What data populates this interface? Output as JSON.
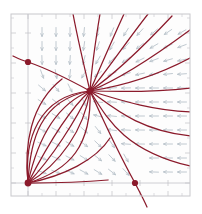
{
  "figure": {
    "kind": "phase-portrait",
    "width": 202,
    "height": 214,
    "background_color": "#ffffff",
    "plot_background_color": "#fdfdfd",
    "frame_color": "#c8c8cc",
    "axis_color": "#c2c2c8",
    "tick_color": "#c8c8cc",
    "trajectory_color": "#8b1a2b",
    "arrow_color": "#b9c3cb",
    "fixed_point_color": "#8b1a2b"
  },
  "chart_data": {
    "type": "scatter",
    "title": "",
    "subtitle": "",
    "xlabel": "",
    "ylabel": "",
    "grid": false,
    "legend_position": "none",
    "axis_ranges": {
      "xlim": [
        -0.5,
        4.5
      ],
      "ylim": [
        -0.5,
        4.5
      ]
    },
    "frame_px": {
      "left": 11,
      "top": 14,
      "right": 190,
      "bottom": 196
    },
    "axes_px": {
      "vertical_x": 28,
      "horizontal_y": 183
    },
    "tick_labels": {
      "x": [],
      "y": []
    },
    "tick_positions_px": {
      "x": [
        28,
        56,
        84,
        112,
        140,
        168
      ],
      "y": [
        183,
        153,
        123,
        93,
        63,
        33
      ],
      "minor_x": [
        42,
        70,
        98,
        126,
        154,
        182
      ],
      "minor_y": [
        168,
        138,
        108,
        78,
        48,
        18
      ]
    },
    "fixed_points": [
      {
        "name": "left-equilibrium",
        "x_px": 28,
        "y_px": 62,
        "type": "saddle",
        "radius_px": 3.1
      },
      {
        "name": "origin-node",
        "x_px": 28,
        "y_px": 183,
        "type": "unstable-node",
        "radius_px": 3.4
      },
      {
        "name": "right-equilibrium",
        "x_px": 135,
        "y_px": 183,
        "type": "saddle",
        "radius_px": 3.1
      },
      {
        "name": "interior-node",
        "x_px": 90,
        "y_px": 91,
        "type": "stable-node",
        "radius_px": 3.4
      }
    ],
    "vector_field": {
      "description": "arrow glyphs on a regular lattice; arrows point down in upper-left region, down-left in upper-right, left along the right band, and up-right in the lower-middle region",
      "glyph_length_px": 9,
      "lattice_spacing_px": 14,
      "arrows": [
        {
          "x": 42,
          "y": 32,
          "angle": 90
        },
        {
          "x": 56,
          "y": 32,
          "angle": 90
        },
        {
          "x": 70,
          "y": 32,
          "angle": 90
        },
        {
          "x": 84,
          "y": 32,
          "angle": 96
        },
        {
          "x": 98,
          "y": 32,
          "angle": 104
        },
        {
          "x": 112,
          "y": 32,
          "angle": 112
        },
        {
          "x": 126,
          "y": 32,
          "angle": 122
        },
        {
          "x": 140,
          "y": 32,
          "angle": 132
        },
        {
          "x": 154,
          "y": 32,
          "angle": 140
        },
        {
          "x": 168,
          "y": 32,
          "angle": 146
        },
        {
          "x": 182,
          "y": 32,
          "angle": 150
        },
        {
          "x": 42,
          "y": 46,
          "angle": 90
        },
        {
          "x": 56,
          "y": 46,
          "angle": 90
        },
        {
          "x": 70,
          "y": 46,
          "angle": 92
        },
        {
          "x": 84,
          "y": 46,
          "angle": 98
        },
        {
          "x": 98,
          "y": 46,
          "angle": 108
        },
        {
          "x": 112,
          "y": 46,
          "angle": 120
        },
        {
          "x": 126,
          "y": 46,
          "angle": 132
        },
        {
          "x": 140,
          "y": 46,
          "angle": 142
        },
        {
          "x": 154,
          "y": 46,
          "angle": 150
        },
        {
          "x": 168,
          "y": 46,
          "angle": 156
        },
        {
          "x": 182,
          "y": 46,
          "angle": 160
        },
        {
          "x": 42,
          "y": 60,
          "angle": 88
        },
        {
          "x": 56,
          "y": 60,
          "angle": 90
        },
        {
          "x": 70,
          "y": 60,
          "angle": 94
        },
        {
          "x": 84,
          "y": 60,
          "angle": 104
        },
        {
          "x": 98,
          "y": 60,
          "angle": 120
        },
        {
          "x": 112,
          "y": 60,
          "angle": 134
        },
        {
          "x": 126,
          "y": 60,
          "angle": 146
        },
        {
          "x": 140,
          "y": 60,
          "angle": 154
        },
        {
          "x": 154,
          "y": 60,
          "angle": 160
        },
        {
          "x": 168,
          "y": 60,
          "angle": 164
        },
        {
          "x": 182,
          "y": 60,
          "angle": 168
        },
        {
          "x": 42,
          "y": 74,
          "angle": 70
        },
        {
          "x": 56,
          "y": 74,
          "angle": 80
        },
        {
          "x": 70,
          "y": 74,
          "angle": 96
        },
        {
          "x": 84,
          "y": 74,
          "angle": 120
        },
        {
          "x": 98,
          "y": 74,
          "angle": 142
        },
        {
          "x": 112,
          "y": 74,
          "angle": 155
        },
        {
          "x": 126,
          "y": 74,
          "angle": 163
        },
        {
          "x": 140,
          "y": 74,
          "angle": 168
        },
        {
          "x": 154,
          "y": 74,
          "angle": 171
        },
        {
          "x": 168,
          "y": 74,
          "angle": 174
        },
        {
          "x": 182,
          "y": 74,
          "angle": 176
        },
        {
          "x": 42,
          "y": 88,
          "angle": 40
        },
        {
          "x": 56,
          "y": 88,
          "angle": 50
        },
        {
          "x": 70,
          "y": 88,
          "angle": 64
        },
        {
          "x": 98,
          "y": 88,
          "angle": 172
        },
        {
          "x": 112,
          "y": 88,
          "angle": 176
        },
        {
          "x": 126,
          "y": 88,
          "angle": 178
        },
        {
          "x": 140,
          "y": 88,
          "angle": 179
        },
        {
          "x": 154,
          "y": 88,
          "angle": 180
        },
        {
          "x": 168,
          "y": 88,
          "angle": 180
        },
        {
          "x": 182,
          "y": 88,
          "angle": 180
        },
        {
          "x": 42,
          "y": 102,
          "angle": 32
        },
        {
          "x": 56,
          "y": 102,
          "angle": 38
        },
        {
          "x": 70,
          "y": 102,
          "angle": 48
        },
        {
          "x": 84,
          "y": 102,
          "angle": 64
        },
        {
          "x": 98,
          "y": 102,
          "angle": 186
        },
        {
          "x": 112,
          "y": 102,
          "angle": 183
        },
        {
          "x": 126,
          "y": 102,
          "angle": 181
        },
        {
          "x": 140,
          "y": 102,
          "angle": 180
        },
        {
          "x": 154,
          "y": 102,
          "angle": 180
        },
        {
          "x": 168,
          "y": 102,
          "angle": 180
        },
        {
          "x": 182,
          "y": 102,
          "angle": 180
        },
        {
          "x": 42,
          "y": 116,
          "angle": 28
        },
        {
          "x": 56,
          "y": 116,
          "angle": 32
        },
        {
          "x": 70,
          "y": 116,
          "angle": 40
        },
        {
          "x": 84,
          "y": 116,
          "angle": 50
        },
        {
          "x": 98,
          "y": 116,
          "angle": 194
        },
        {
          "x": 112,
          "y": 116,
          "angle": 186
        },
        {
          "x": 126,
          "y": 116,
          "angle": 182
        },
        {
          "x": 140,
          "y": 116,
          "angle": 180
        },
        {
          "x": 154,
          "y": 116,
          "angle": 180
        },
        {
          "x": 168,
          "y": 116,
          "angle": 180
        },
        {
          "x": 182,
          "y": 116,
          "angle": 180
        },
        {
          "x": 42,
          "y": 130,
          "angle": 26
        },
        {
          "x": 56,
          "y": 130,
          "angle": 28
        },
        {
          "x": 70,
          "y": 130,
          "angle": 34
        },
        {
          "x": 84,
          "y": 130,
          "angle": 42
        },
        {
          "x": 98,
          "y": 130,
          "angle": 52
        },
        {
          "x": 112,
          "y": 130,
          "angle": 188
        },
        {
          "x": 126,
          "y": 130,
          "angle": 183
        },
        {
          "x": 140,
          "y": 130,
          "angle": 181
        },
        {
          "x": 154,
          "y": 130,
          "angle": 180
        },
        {
          "x": 168,
          "y": 130,
          "angle": 180
        },
        {
          "x": 182,
          "y": 130,
          "angle": 180
        },
        {
          "x": 42,
          "y": 144,
          "angle": 24
        },
        {
          "x": 56,
          "y": 144,
          "angle": 26
        },
        {
          "x": 70,
          "y": 144,
          "angle": 30
        },
        {
          "x": 84,
          "y": 144,
          "angle": 36
        },
        {
          "x": 98,
          "y": 144,
          "angle": 44
        },
        {
          "x": 112,
          "y": 144,
          "angle": 56
        },
        {
          "x": 126,
          "y": 144,
          "angle": 184
        },
        {
          "x": 140,
          "y": 144,
          "angle": 181
        },
        {
          "x": 154,
          "y": 144,
          "angle": 180
        },
        {
          "x": 168,
          "y": 144,
          "angle": 180
        },
        {
          "x": 182,
          "y": 144,
          "angle": 180
        },
        {
          "x": 42,
          "y": 158,
          "angle": 22
        },
        {
          "x": 56,
          "y": 158,
          "angle": 24
        },
        {
          "x": 70,
          "y": 158,
          "angle": 27
        },
        {
          "x": 84,
          "y": 158,
          "angle": 32
        },
        {
          "x": 98,
          "y": 158,
          "angle": 38
        },
        {
          "x": 112,
          "y": 158,
          "angle": 46
        },
        {
          "x": 126,
          "y": 158,
          "angle": 60
        },
        {
          "x": 154,
          "y": 158,
          "angle": 180
        },
        {
          "x": 168,
          "y": 158,
          "angle": 180
        },
        {
          "x": 182,
          "y": 158,
          "angle": 180
        },
        {
          "x": 42,
          "y": 172,
          "angle": 20
        },
        {
          "x": 56,
          "y": 172,
          "angle": 22
        },
        {
          "x": 70,
          "y": 172,
          "angle": 24
        },
        {
          "x": 84,
          "y": 172,
          "angle": 28
        },
        {
          "x": 98,
          "y": 172,
          "angle": 32
        },
        {
          "x": 112,
          "y": 172,
          "angle": 38
        },
        {
          "x": 126,
          "y": 172,
          "angle": 48
        },
        {
          "x": 154,
          "y": 172,
          "angle": 182
        },
        {
          "x": 168,
          "y": 172,
          "angle": 181
        },
        {
          "x": 182,
          "y": 172,
          "angle": 180
        }
      ]
    },
    "trajectories": [
      {
        "name": "sep-left-into-center",
        "path": "M 28 62 C 48 69 70 80 90 91"
      },
      {
        "name": "sep-left-upper",
        "path": "M 13 56 C 19 59 24 61 28 62"
      },
      {
        "name": "fan-up-1",
        "path": "M 90 91 C 84 66 78 40 73 14"
      },
      {
        "name": "fan-up-2",
        "path": "M 90 91 C 92 64 96 38 100 14"
      },
      {
        "name": "fan-up-3",
        "path": "M 90 91 C 100 68 112 40 124 14"
      },
      {
        "name": "fan-up-4",
        "path": "M 90 91 C 106 72 126 42 148 14"
      },
      {
        "name": "fan-up-5",
        "path": "M 90 91 C 112 76 142 48 172 16"
      },
      {
        "name": "fan-up-6",
        "path": "M 90 91 C 118 80 152 58 190 30"
      },
      {
        "name": "fan-right-1",
        "path": "M 90 91 C 122 86 156 76 190 58"
      },
      {
        "name": "fan-right-2",
        "path": "M 90 91 C 124 92 158 92 190 88"
      },
      {
        "name": "fan-right-3",
        "path": "M 90 91 C 120 100 150 110 190 112"
      },
      {
        "name": "fan-right-4",
        "path": "M 90 91 C 114 108 138 130 190 136"
      },
      {
        "name": "fan-right-5",
        "path": "M 90 91 C 106 116 122 150 190 166"
      },
      {
        "name": "sep-center-to-right-point",
        "path": "M 90 91 C 104 122 120 156 135 183"
      },
      {
        "name": "sep-right-below",
        "path": "M 135 183 C 139 191 143 198 147 207"
      },
      {
        "name": "node-to-center-1",
        "path": "M 28 183 C 30 140 40 100 90 91"
      },
      {
        "name": "node-to-center-2",
        "path": "M 28 183 C 36 146 52 106 90 91"
      },
      {
        "name": "node-to-center-3",
        "path": "M 28 183 C 44 152 66 112 90 91"
      },
      {
        "name": "node-to-center-4",
        "path": "M 28 183 C 52 158 76 120 90 91"
      },
      {
        "name": "node-to-center-5",
        "path": "M 28 183 C 60 164 84 130 90 91"
      },
      {
        "name": "node-to-center-6",
        "path": "M 28 183 C 70 170 92 146 90 91"
      },
      {
        "name": "node-arc-upper-left",
        "path": "M 28 183 C 24 140 38 96 90 91"
      },
      {
        "name": "node-left-branch",
        "path": "M 28 183 C 24 146 30 104 62 79"
      },
      {
        "name": "node-flat-right",
        "path": "M 28 183 C 60 183 86 182 108 180"
      },
      {
        "name": "node-low-arc",
        "path": "M 28 183 C 64 176 96 160 110 138"
      }
    ]
  }
}
